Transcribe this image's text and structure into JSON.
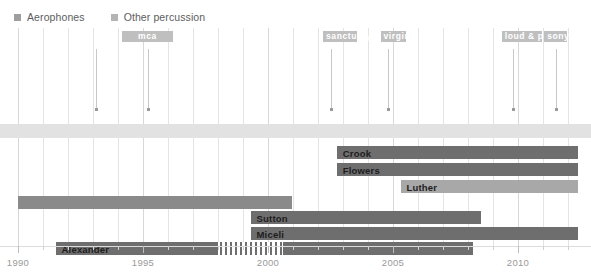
{
  "legend": {
    "items": [
      {
        "label": "Aerophones",
        "color": "#9e9e9e",
        "icon": "square-swatch-icon"
      },
      {
        "label": "Other percussion",
        "color": "#b4b4b4",
        "icon": "square-swatch-icon"
      }
    ]
  },
  "axis": {
    "label_min": "1990",
    "label_max": "2012.4",
    "ticks": [
      "1990",
      "1995",
      "2000",
      "2005",
      "2010"
    ],
    "tick_values": [
      1990,
      1995,
      2000,
      2005,
      2010
    ],
    "minor_step": "1",
    "grid": "vertical-year-lines"
  },
  "record_labels": [
    {
      "name": "mca",
      "start": 1994.15,
      "end": 1996.2,
      "color": "#bfbfbf"
    },
    {
      "name": "sanctuary",
      "start": 2002.2,
      "end": 2003.55,
      "color": "#bfbfbf"
    },
    {
      "name": "virgin",
      "start": 2004.5,
      "end": 2005.5,
      "color": "#bfbfbf"
    },
    {
      "name": "loud & proud",
      "start": 2009.35,
      "end": 2010.95,
      "color": "#bfbfbf"
    },
    {
      "name": "sony",
      "start": 2011.05,
      "end": 2011.95,
      "color": "#bfbfbf"
    }
  ],
  "events": [
    {
      "year": 1993.1,
      "lines": [
        "Not Out of Hell II",
        "Back into Hell"
      ]
    },
    {
      "year": 1995.2,
      "lines": [
        "Welcome to the",
        "Neighbourhood"
      ]
    },
    {
      "year": 2002.5,
      "lines": [
        "Couldn't Have Said",
        "It Better"
      ]
    },
    {
      "year": 2004.8,
      "lines": [
        "Not Out of Hell III",
        "The Monster is Loose"
      ]
    },
    {
      "year": 2009.8,
      "lines": [
        "Hang Cool Teddy Bear"
      ]
    },
    {
      "year": 2011.5,
      "lines": [
        "Hell in a Handbasket"
      ]
    }
  ],
  "chart_data": {
    "type": "bar",
    "title": "",
    "xlabel": "",
    "ylabel": "",
    "xlim": [
      1990,
      2012.4
    ],
    "grid": true,
    "legend_position": "top-left",
    "series": [
      {
        "name": "Aerophones",
        "color": "#9e9e9e"
      },
      {
        "name": "Other percussion",
        "color": "#b4b4b4"
      }
    ],
    "rows": [
      {
        "label": "",
        "start": 1990,
        "end": 2012.4,
        "color": "#e2e2e2",
        "kind": "band",
        "label_visible": false
      },
      {
        "label": "Crook",
        "start": 2002.75,
        "end": 2012.4,
        "color": "#6e6e6e",
        "kind": "bar",
        "label_visible": true
      },
      {
        "label": "Flowers",
        "start": 2002.75,
        "end": 2012.4,
        "color": "#6e6e6e",
        "kind": "bar",
        "label_visible": true
      },
      {
        "label": "Luther",
        "start": 2005.3,
        "end": 2012.4,
        "color": "#a8a8a8",
        "kind": "bar",
        "label_visible": true
      },
      {
        "label": "",
        "start": 1990,
        "end": 2000.95,
        "color": "#8a8a8a",
        "kind": "bar",
        "label_visible": false
      },
      {
        "label": "Sutton",
        "start": 1999.3,
        "end": 2008.5,
        "color": "#6e6e6e",
        "kind": "bar",
        "label_visible": true
      },
      {
        "label": "Miceli",
        "start": 1999.3,
        "end": 2012.4,
        "color": "#6e6e6e",
        "kind": "bar",
        "label_visible": true
      },
      {
        "label": "Alexander",
        "start": 1991.5,
        "end": 2008.2,
        "color": "#6e6e6e",
        "kind": "bar",
        "label_visible": true,
        "gap": {
          "start": 1998.0,
          "end": 2000.6,
          "style": "hatched-vertical-stripes",
          "stripes": 13
        }
      }
    ]
  }
}
